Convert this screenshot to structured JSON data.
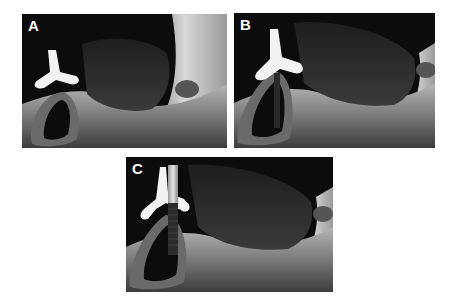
{
  "figure": {
    "panels": [
      {
        "label": "A",
        "description": "3D rendered jaw with tooth-shaped surgical guide, empty socket"
      },
      {
        "label": "B",
        "description": "3D rendered jaw with guide and planned implant channel"
      },
      {
        "label": "C",
        "description": "3D rendered jaw with guide and placed implant"
      }
    ]
  },
  "colors": {
    "background": "#ffffff",
    "panel_bg": "#0c0c0c",
    "soft_tissue": "#2e2e2e",
    "bone_light": "#a8a8a8",
    "bone_mid": "#6e6e6e",
    "guide": "#f2f2f2",
    "implant_tip": "#c8c8c8",
    "implant_body": "#3a3a3a"
  }
}
